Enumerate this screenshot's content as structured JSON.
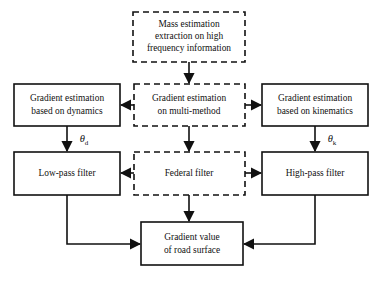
{
  "diagram": {
    "colors": {
      "stroke": "#111111",
      "background": "#ffffff",
      "box_fill": "#ffffff"
    },
    "nodes": {
      "mass_estimation": {
        "line1": "Mass estimation",
        "line2": "extraction  on high",
        "line3": "frequency information",
        "style": "dashed"
      },
      "gradient_dynamics": {
        "line1": "Gradient estimation",
        "line2": "based on dynamics",
        "style": "solid"
      },
      "gradient_multimethod": {
        "line1": "Gradient estimation",
        "line2": "on multi-method",
        "style": "dashed"
      },
      "gradient_kinematics": {
        "line1": "Gradient estimation",
        "line2": "based on kinematics",
        "style": "solid"
      },
      "low_pass_filter": {
        "line1": "Low-pass filter",
        "style": "solid"
      },
      "federal_filter": {
        "line1": "Federal filter",
        "style": "dashed"
      },
      "high_pass_filter": {
        "line1": "High-pass filter",
        "style": "solid"
      },
      "gradient_value": {
        "line1": "Gradient value",
        "line2": "of road surface",
        "style": "solid"
      }
    },
    "edge_labels": {
      "theta_d": {
        "symbol": "θ",
        "subscript": "d"
      },
      "theta_k": {
        "symbol": "θ",
        "subscript": "k"
      }
    }
  }
}
